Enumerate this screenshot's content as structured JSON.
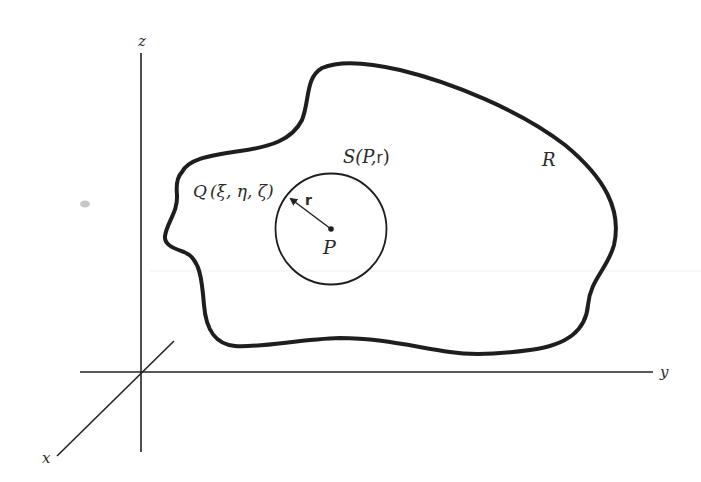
{
  "figure": {
    "axes": {
      "z_label": "z",
      "y_label": "y",
      "x_label": "x"
    },
    "region": {
      "label": "R"
    },
    "sphere": {
      "label_prefix": "S",
      "label_args_open": "(P,",
      "label_radius": "r",
      "label_close": ")",
      "center_label": "P",
      "radius_label": "r"
    },
    "point_q": {
      "label_name": "Q",
      "label_coords": "(ξ, η, ζ)"
    },
    "colors": {
      "ink": "#222222",
      "background": "#ffffff"
    }
  }
}
